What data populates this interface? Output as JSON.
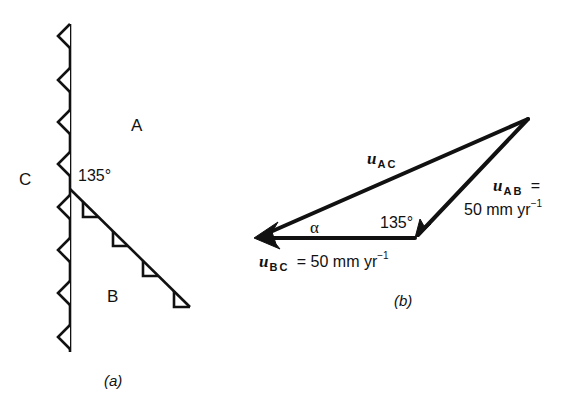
{
  "panel_a": {
    "caption": "(a)",
    "regions": {
      "a": "A",
      "b": "B",
      "c": "C"
    },
    "junction_angle": "135°"
  },
  "panel_b": {
    "caption": "(b)",
    "vectors": {
      "ac": {
        "symbol": "u",
        "sub": "AC"
      },
      "ab": {
        "symbol": "u",
        "sub": "AB",
        "eq": "=",
        "value": "50 mm yr",
        "exp": "−1"
      },
      "bc": {
        "symbol": "u",
        "sub": "BC",
        "eq": "= 50 mm yr",
        "exp": "−1"
      }
    },
    "angle_alpha": "α",
    "angle_inner": "135°"
  },
  "colors": {
    "ink": "#111111",
    "background": "#ffffff"
  }
}
